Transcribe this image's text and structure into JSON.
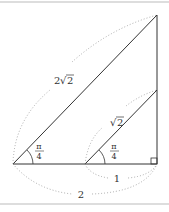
{
  "figure": {
    "type": "geometry-diagram",
    "colors": {
      "line": "#333333",
      "dotted": "#888888",
      "border": "#bbbbbb",
      "background": "#ffffff"
    },
    "labels": {
      "big_hypotenuse": {
        "coef": "2",
        "radicand": "2"
      },
      "small_hypotenuse": {
        "radicand": "2"
      },
      "big_angle": {
        "num": "π",
        "den": "4"
      },
      "small_angle": {
        "num": "π",
        "den": "4"
      },
      "small_base": "1",
      "big_base": "2"
    },
    "right_angle_marker": true
  }
}
